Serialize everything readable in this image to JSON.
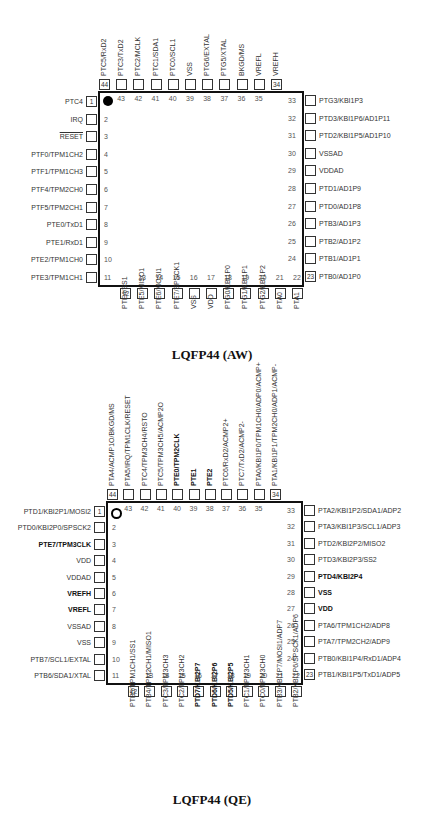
{
  "packages": [
    {
      "caption": "LQFP44 (AW)",
      "body": {
        "x": 98,
        "y": 91,
        "w": 206,
        "h": 196
      },
      "marker": "filled-dot",
      "left_pins": [
        {
          "num": "1",
          "label": "PTC4"
        },
        {
          "num": "2",
          "label": "IRQ"
        },
        {
          "num": "3",
          "label": "RESET",
          "overline": true
        },
        {
          "num": "4",
          "label": "PTF0/TPM1CH2"
        },
        {
          "num": "5",
          "label": "PTF1/TPM1CH3"
        },
        {
          "num": "6",
          "label": "PTF4/TPM2CH0"
        },
        {
          "num": "7",
          "label": "PTF5/TPM2CH1"
        },
        {
          "num": "8",
          "label": "PTE0/TxD1"
        },
        {
          "num": "9",
          "label": "PTE1/RxD1"
        },
        {
          "num": "10",
          "label": "PTE2/TPM1CH0"
        },
        {
          "num": "11",
          "label": "PTE3/TPM1CH1"
        }
      ],
      "bottom_pins": [
        {
          "num": "12",
          "label": "PTE4/SS1"
        },
        {
          "num": "13",
          "label": "PTE5/MISO1"
        },
        {
          "num": "14",
          "label": "PTE6/MOSI1"
        },
        {
          "num": "15",
          "label": "PTE7/SPSCK1"
        },
        {
          "num": "16",
          "label": "VSS"
        },
        {
          "num": "17",
          "label": "VDD"
        },
        {
          "num": "18",
          "label": "PTG0/KBI1P0"
        },
        {
          "num": "19",
          "label": "PTG1/KBI1P1"
        },
        {
          "num": "20",
          "label": "PTG2/KBI1P2"
        },
        {
          "num": "21",
          "label": "PTA0"
        },
        {
          "num": "22",
          "label": "PTA1"
        }
      ],
      "right_pins": [
        {
          "num": "23",
          "label": "PTB0/AD1P0"
        },
        {
          "num": "24",
          "label": "PTB1/AD1P1"
        },
        {
          "num": "25",
          "label": "PTB2/AD1P2"
        },
        {
          "num": "26",
          "label": "PTB3/AD1P3"
        },
        {
          "num": "27",
          "label": "PTD0/AD1P8"
        },
        {
          "num": "28",
          "label": "PTD1/AD1P9"
        },
        {
          "num": "29",
          "label": "VDDAD"
        },
        {
          "num": "30",
          "label": "VSSAD"
        },
        {
          "num": "31",
          "label": "PTD2/KBI1P5/AD1P10"
        },
        {
          "num": "32",
          "label": "PTD3/KBI1P6/AD1P11"
        },
        {
          "num": "33",
          "label": "PTG3/KBI1P3"
        }
      ],
      "top_pins": [
        {
          "num": "34",
          "label": "VREFH"
        },
        {
          "num": "35",
          "label": "VREFL"
        },
        {
          "num": "36",
          "label": "BKGD/MS"
        },
        {
          "num": "37",
          "label": "PTG5/XTAL"
        },
        {
          "num": "38",
          "label": "PTG6/EXTAL"
        },
        {
          "num": "39",
          "label": "VSS"
        },
        {
          "num": "40",
          "label": "PTC0/SCL1"
        },
        {
          "num": "41",
          "label": "PTC1/SDA1"
        },
        {
          "num": "42",
          "label": "PTC2/MCLK"
        },
        {
          "num": "43",
          "label": "PTC3/TxD2"
        },
        {
          "num": "44",
          "label": "PTC5/RxD2"
        }
      ]
    },
    {
      "caption": "LQFP44 (QE)",
      "body": {
        "x": 106,
        "y": 501,
        "w": 197,
        "h": 184
      },
      "marker": "ring",
      "left_pins": [
        {
          "num": "1",
          "label": "PTD1/KBI2P1/MOSI2"
        },
        {
          "num": "2",
          "label": "PTD0/KBI2P0/SPSCK2"
        },
        {
          "num": "3",
          "label": "PTE7/TPM3CLK",
          "bold": true
        },
        {
          "num": "4",
          "label": "VDD"
        },
        {
          "num": "5",
          "label": "VDDAD"
        },
        {
          "num": "6",
          "label": "VREFH",
          "bold": true
        },
        {
          "num": "7",
          "label": "VREFL",
          "bold": true
        },
        {
          "num": "8",
          "label": "VSSAD"
        },
        {
          "num": "9",
          "label": "VSS"
        },
        {
          "num": "10",
          "label": "PTB7/SCL1/EXTAL"
        },
        {
          "num": "11",
          "label": "PTB6/SDA1/XTAL"
        }
      ],
      "bottom_pins": [
        {
          "num": "12",
          "label": "PTB5/TPM1CH1/SS1"
        },
        {
          "num": "13",
          "label": "PTB4/TPM2CH1/MISO1"
        },
        {
          "num": "14",
          "label": "PTC3/TPM3CH3"
        },
        {
          "num": "15",
          "label": "PTC2/TPM3CH2"
        },
        {
          "num": "16",
          "label": "PTD7/KBI2P7",
          "bold": true
        },
        {
          "num": "17",
          "label": "PTD6/KBI2P6",
          "bold": true
        },
        {
          "num": "18",
          "label": "PTD5/KBI2P5",
          "bold": true
        },
        {
          "num": "19",
          "label": "PTC1/TPM3CH1"
        },
        {
          "num": "20",
          "label": "PTC0/TPM3CH0"
        },
        {
          "num": "21",
          "label": "PTB3/KBI1P7/MOSI1/ADP7"
        },
        {
          "num": "22",
          "label": "PTB2/KBI1P6/SPSCK1/ADP6"
        }
      ],
      "right_pins": [
        {
          "num": "23",
          "label": "PTB1/KBI1P5/TxD1/ADP5"
        },
        {
          "num": "24",
          "label": "PTB0/KBI1P4/RxD1/ADP4"
        },
        {
          "num": "25",
          "label": "PTA7/TPM2CH2/ADP9"
        },
        {
          "num": "26",
          "label": "PTA6/TPM1CH2/ADP8"
        },
        {
          "num": "27",
          "label": "VDD",
          "bold": true
        },
        {
          "num": "28",
          "label": "VSS",
          "bold": true
        },
        {
          "num": "29",
          "label": "PTD4/KBI2P4",
          "bold": true
        },
        {
          "num": "30",
          "label": "PTD3/KBI2P3/SS2"
        },
        {
          "num": "31",
          "label": "PTD2/KBI2P2/MISO2"
        },
        {
          "num": "32",
          "label": "PTA3/KBI1P3/SCL1/ADP3"
        },
        {
          "num": "33",
          "label": "PTA2/KBI1P2/SDA1/ADP2"
        }
      ],
      "top_pins": [
        {
          "num": "34",
          "label": "PTA1/KBI1P1/TPM2CH0/ADP1/ACMP-"
        },
        {
          "num": "35",
          "label": "PTA0/KBI1P0/TPM1CH0/ADP0/ACMP+"
        },
        {
          "num": "36",
          "label": "PTC7/TxD2/ACMP2-"
        },
        {
          "num": "37",
          "label": "PTC6/RxD2/ACMP2+"
        },
        {
          "num": "38",
          "label": "PTE2",
          "bold": true
        },
        {
          "num": "39",
          "label": "PTE1",
          "bold": true
        },
        {
          "num": "40",
          "label": "PTE0/TPM2CLK",
          "bold": true
        },
        {
          "num": "41",
          "label": "PTC5/TPM3CH5/ACMP2O"
        },
        {
          "num": "42",
          "label": "PTC4/TPM3CH4/RSTO"
        },
        {
          "num": "43",
          "label": "PTA5/IRQ/TPM1CLK/RESET"
        },
        {
          "num": "44",
          "label": "PTA4/ACMP1O/BKGD/MS"
        }
      ]
    }
  ]
}
